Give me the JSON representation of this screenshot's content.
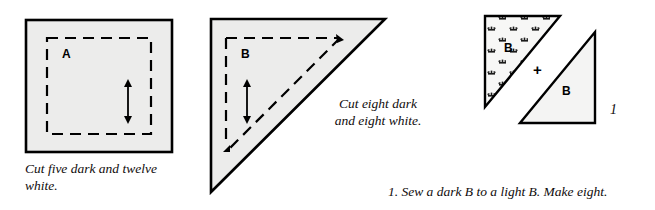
{
  "page": {
    "width": 655,
    "height": 210,
    "background": "#ffffff"
  },
  "colors": {
    "outline": "#000000",
    "light_fill": "#ececeb",
    "dark_fill": "#f2f2f1",
    "text": "#100c0c",
    "dashed_seam": "#000000"
  },
  "figures": [
    {
      "id": "square-a",
      "type": "square-template",
      "piece_label": "A",
      "caption": "Cut five dark and twelve\nwhite.",
      "grain_arrow": "vertical-double-arrow",
      "seam_line": "dashed-square"
    },
    {
      "id": "triangle-b",
      "type": "triangle-template",
      "piece_label": "B",
      "caption": "Cut eight dark\nand eight white.",
      "grain_arrow": "vertical-double-arrow",
      "seam_line": "dashed-triangle"
    },
    {
      "id": "unit-assembly",
      "type": "pieced-unit",
      "dark_piece_label": "B",
      "light_piece_label": "B",
      "operator": "+",
      "figure_number": "1"
    }
  ],
  "captions": {
    "square": "Cut five dark and twelve\nwhite.",
    "triangle": "Cut eight dark\nand eight white.",
    "step": "1.  Sew a dark B to a light B. Make eight."
  },
  "labels": {
    "square_piece": "A",
    "triangle_piece": "B",
    "unit_dark_piece": "B",
    "unit_light_piece": "B",
    "plus": "+",
    "figure_number": "1"
  }
}
